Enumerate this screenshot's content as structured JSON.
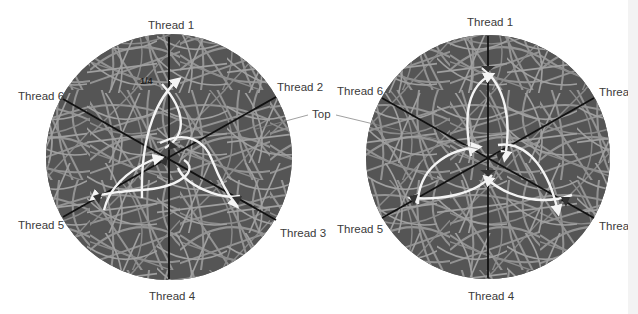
{
  "diagrams": [
    {
      "id": "left",
      "center": [
        169,
        157
      ],
      "radius": 123,
      "labels": {
        "t1": "Thread 1",
        "t2": "Thread 2",
        "t3": "Thread 3",
        "t4": "Thread 4",
        "t5": "Thread 5",
        "t6": "Thread 6"
      },
      "annotation": "1/4"
    },
    {
      "id": "right",
      "center": [
        488,
        157
      ],
      "radius": 122,
      "labels": {
        "t1": "Thread 1",
        "t2": "Thread",
        "t3": "Thread",
        "t4": "Thread 4",
        "t5": "Thread 5",
        "t6": "Thread 6"
      }
    }
  ],
  "callout": {
    "label": "Top"
  },
  "colors": {
    "disc": "#5f5f5f",
    "disc_dark": "#4a4a4a",
    "strands": "#9a9a9a",
    "thread_lines": "#111111",
    "path": "#f4f4f4",
    "label": "#3a3a3a"
  }
}
